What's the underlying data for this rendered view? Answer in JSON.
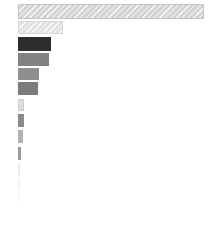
{
  "chart_data": {
    "type": "bar",
    "orientation": "horizontal",
    "title": "",
    "subtitle": "",
    "xlabel": "",
    "ylabel": "",
    "grid": false,
    "legend": false,
    "legend_position": "none",
    "axis_visible": false,
    "tick_labels_visible": false,
    "categories": [
      "1",
      "2",
      "3",
      "4",
      "5",
      "6",
      "7",
      "8",
      "9",
      "10",
      "11",
      "12",
      "13"
    ],
    "values": [
      186,
      45,
      33,
      31,
      21,
      20,
      6,
      6,
      5,
      3,
      1,
      1,
      1
    ],
    "value_unit": "px",
    "xlim": [
      0,
      186
    ],
    "bar_colors": [
      "#d4d4d4",
      "#e2e2e2",
      "#2d2d2d",
      "#828282",
      "#8e8e8e",
      "#7c7c7c",
      "#dcdcdc",
      "#8a8a8a",
      "#b2b2b2",
      "#9a9a9a",
      "#f2f2f2",
      "#f6f6f6",
      "#fafafa"
    ],
    "bar_edge_colors": [
      "#c4c4c4",
      "#d8d8d8",
      "#2d2d2d",
      "#828282",
      "#8e8e8e",
      "#7c7c7c",
      "#d0d0d0",
      "#8a8a8a",
      "#b2b2b2",
      "#9a9a9a",
      "#ececec",
      "#f2f2f2",
      "#f7f7f7"
    ],
    "bar_patterns": [
      "diagonal-hatch",
      "diagonal-hatch",
      "solid",
      "solid",
      "solid",
      "solid",
      "solid",
      "solid",
      "solid",
      "solid",
      "solid",
      "solid",
      "solid"
    ],
    "bar_geometry": [
      {
        "x": 18,
        "y": 4,
        "w": 186,
        "h": 15
      },
      {
        "x": 18,
        "y": 21,
        "w": 45,
        "h": 13
      },
      {
        "x": 18,
        "y": 37,
        "w": 33,
        "h": 14
      },
      {
        "x": 18,
        "y": 53,
        "w": 31,
        "h": 13
      },
      {
        "x": 18,
        "y": 68,
        "w": 21,
        "h": 12
      },
      {
        "x": 18,
        "y": 82,
        "w": 20,
        "h": 13
      },
      {
        "x": 18,
        "y": 99,
        "w": 6,
        "h": 12
      },
      {
        "x": 18,
        "y": 114,
        "w": 6,
        "h": 13
      },
      {
        "x": 18,
        "y": 130,
        "w": 5,
        "h": 13
      },
      {
        "x": 18,
        "y": 147,
        "w": 3,
        "h": 13
      },
      {
        "x": 18,
        "y": 163,
        "w": 2,
        "h": 13
      },
      {
        "x": 18,
        "y": 178,
        "w": 2,
        "h": 12
      },
      {
        "x": 18,
        "y": 192,
        "w": 2,
        "h": 10
      }
    ],
    "background_color": "#ffffff",
    "annotations": []
  },
  "figure": {
    "width": 213,
    "height": 249
  }
}
